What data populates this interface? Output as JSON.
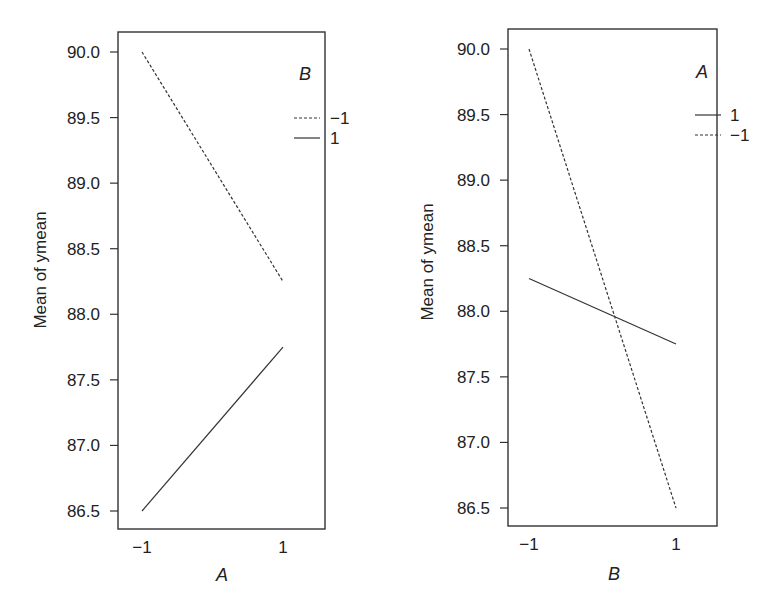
{
  "chart_data": [
    {
      "type": "line",
      "title": "Interaction plot: Mean of ymean vs A",
      "xlabel": "A",
      "ylabel": "Mean of ymean",
      "x": [
        -1,
        1
      ],
      "x_tick_labels": [
        "−1",
        "1"
      ],
      "y_ticks": [
        86.5,
        87.0,
        87.5,
        88.0,
        88.5,
        89.0,
        89.5,
        90.0
      ],
      "y_tick_labels": [
        "86.5",
        "87.0",
        "87.5",
        "88.0",
        "88.5",
        "89.0",
        "89.5",
        "90.0"
      ],
      "ylim": [
        86.35,
        90.15
      ],
      "grid": false,
      "legend": {
        "title": "B",
        "position": "right-top",
        "entries": [
          {
            "label": "−1",
            "style": "dashed"
          },
          {
            "label": "1",
            "style": "solid"
          }
        ]
      },
      "series": [
        {
          "name": "-1",
          "legend_label": "−1",
          "style": "dashed",
          "values": [
            90.0,
            88.25
          ]
        },
        {
          "name": "1",
          "legend_label": "1",
          "style": "solid",
          "values": [
            86.5,
            87.75
          ]
        }
      ]
    },
    {
      "type": "line",
      "title": "Interaction plot: Mean of ymean vs B",
      "xlabel": "B",
      "ylabel": "Mean of ymean",
      "x": [
        -1,
        1
      ],
      "x_tick_labels": [
        "−1",
        "1"
      ],
      "y_ticks": [
        86.5,
        87.0,
        87.5,
        88.0,
        88.5,
        89.0,
        89.5,
        90.0
      ],
      "y_tick_labels": [
        "86.5",
        "87.0",
        "87.5",
        "88.0",
        "88.5",
        "89.0",
        "89.5",
        "90.0"
      ],
      "ylim": [
        86.35,
        90.15
      ],
      "grid": false,
      "legend": {
        "title": "A",
        "position": "right-top",
        "entries": [
          {
            "label": "1",
            "style": "solid"
          },
          {
            "label": "−1",
            "style": "dashed"
          }
        ]
      },
      "series": [
        {
          "name": "1",
          "legend_label": "1",
          "style": "solid",
          "values": [
            88.25,
            87.75
          ]
        },
        {
          "name": "-1",
          "legend_label": "−1",
          "style": "dashed",
          "values": [
            90.0,
            86.5
          ]
        }
      ]
    }
  ]
}
